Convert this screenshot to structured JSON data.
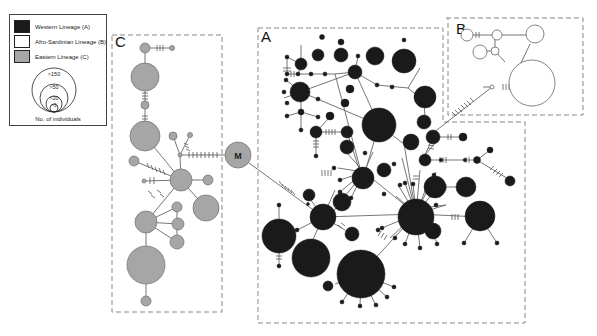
{
  "legend": {
    "items": [
      {
        "label": "Western Lineage (A)",
        "color": "#1a1a1a"
      },
      {
        "label": "Afro-Sardinian Lineage (B)",
        "color": "#ffffff"
      },
      {
        "label": "Eastern Lineage (C)",
        "color": "#a6a6a6"
      }
    ],
    "size_labels": [
      ">150",
      ">50",
      ">20",
      ">5"
    ],
    "footer": "No. of individuals"
  },
  "panels": {
    "A": {
      "label": "A",
      "lineage": "Western Lineage (A)",
      "color": "#1a1a1a"
    },
    "B": {
      "label": "B",
      "lineage": "Afro-Sardinian Lineage (B)",
      "color": "#ffffff"
    },
    "C": {
      "label": "C",
      "lineage": "Eastern Lineage (C)",
      "color": "#a6a6a6"
    }
  },
  "central_node": {
    "label": "M",
    "color": "#a6a6a6"
  },
  "colors": {
    "lineage_A": "#1a1a1a",
    "lineage_B": "#ffffff",
    "lineage_C": "#a6a6a6",
    "edge": "#666666",
    "panel_border": "#888888"
  }
}
